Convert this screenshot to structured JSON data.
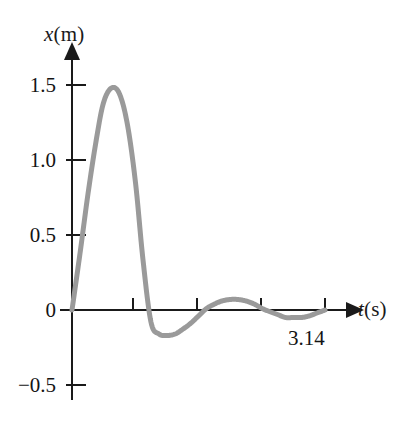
{
  "figure": {
    "background_color": "#ffffff",
    "width": 405,
    "height": 421
  },
  "axes": {
    "y_axis_title_var": "x",
    "y_axis_title_unit": "(m)",
    "x_axis_title_var": "t",
    "x_axis_title_unit": "(s)",
    "axis_color": "#1a1a1a"
  },
  "labels": {
    "y_1_5": "1.5",
    "y_1_0": "1.0",
    "y_0_5": "0.5",
    "y_0": "0",
    "y_neg_0_5": "−0.5",
    "x_pi": "3.14"
  },
  "chart_data": {
    "type": "line",
    "title": "",
    "xlabel": "t (s)",
    "ylabel": "x (m)",
    "xlim": [
      0,
      3.4
    ],
    "ylim": [
      -0.65,
      1.7
    ],
    "grid": false,
    "legend": null,
    "curve_color": "#9a9a9a",
    "curve_width": 5,
    "y_ticks": [
      -0.5,
      0,
      0.5,
      1.0,
      1.5
    ],
    "y_tick_labels": [
      "−0.5",
      "0",
      "0.5",
      "1.0",
      "1.5"
    ],
    "x_ticks": [
      0.785,
      1.57,
      2.355,
      3.14
    ],
    "x_tick_labels": [
      "",
      "",
      "",
      "3.14"
    ],
    "annotations": [
      {
        "text": "3.14",
        "x": 3.14,
        "y": -0.12,
        "note": "tick label under final zero crossing"
      }
    ],
    "series": [
      {
        "name": "x(t)",
        "description": "Damped oscillation starting at origin, large first positive peak then rapidly decaying oscillations returning to zero at t = 3.14 s",
        "x": [
          0.0,
          0.1,
          0.2,
          0.3,
          0.39,
          0.49,
          0.59,
          0.69,
          0.79,
          0.88,
          0.98,
          1.08,
          1.18,
          1.28,
          1.37,
          1.47,
          1.57,
          1.67,
          1.77,
          1.86,
          1.96,
          2.06,
          2.16,
          2.26,
          2.36,
          2.45,
          2.55,
          2.65,
          2.75,
          2.85,
          2.94,
          3.04,
          3.14
        ],
        "y": [
          0.0,
          0.38,
          0.78,
          1.13,
          1.38,
          1.48,
          1.44,
          1.23,
          0.84,
          0.34,
          -0.08,
          -0.16,
          -0.17,
          -0.16,
          -0.13,
          -0.09,
          -0.04,
          0.01,
          0.04,
          0.06,
          0.07,
          0.07,
          0.06,
          0.04,
          0.01,
          -0.01,
          -0.03,
          -0.05,
          -0.05,
          -0.05,
          -0.04,
          -0.02,
          0.0
        ]
      }
    ]
  }
}
